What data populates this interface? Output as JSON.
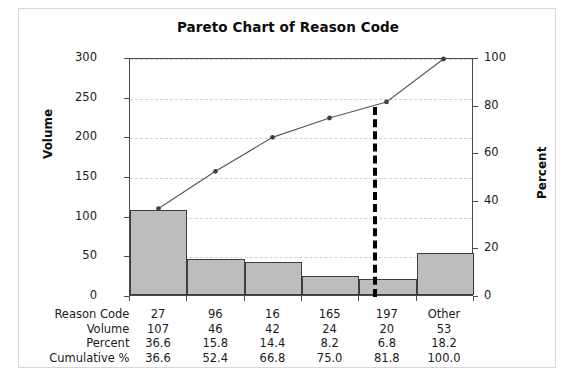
{
  "figure": {
    "title": "Pareto Chart of Reason Code"
  },
  "axes": {
    "left": {
      "label": "Volume",
      "ticks": [
        "0",
        "50",
        "100",
        "150",
        "200",
        "250",
        "300"
      ],
      "min": 0,
      "max": 300,
      "step": 50
    },
    "right": {
      "label": "Percent",
      "ticks": [
        "0",
        "20",
        "40",
        "60",
        "80",
        "100"
      ],
      "min": 0,
      "max": 100,
      "step": 20
    }
  },
  "reference_line": {
    "name": "eighty-percent-reference",
    "percent": 80,
    "color": "#000000",
    "style": "dashed"
  },
  "table": {
    "row_labels": [
      "Reason Code",
      "Volume",
      "Percent",
      "Cumulative %"
    ],
    "rows": [
      [
        "27",
        "96",
        "16",
        "165",
        "197",
        "Other"
      ],
      [
        "107",
        "46",
        "42",
        "24",
        "20",
        "53"
      ],
      [
        "36.6",
        "15.8",
        "14.4",
        "8.2",
        "6.8",
        "18.2"
      ],
      [
        "36.6",
        "52.4",
        "66.8",
        "75.0",
        "81.8",
        "100.0"
      ]
    ]
  },
  "colors": {
    "bar_fill": "#bdbdbd",
    "bar_edge": "#3d3d3d",
    "line": "#5a5a5a",
    "marker": "#404040",
    "grid": "#d2d2d2",
    "frame": "#4a4a4a"
  },
  "chart_data": {
    "type": "bar",
    "title": "Pareto Chart of Reason Code",
    "xlabel": "Reason Code",
    "ylabel": "Volume",
    "y2label": "Percent",
    "categories": [
      "27",
      "96",
      "16",
      "165",
      "197",
      "Other"
    ],
    "values": [
      107,
      46,
      42,
      24,
      20,
      53
    ],
    "percent": [
      36.6,
      15.8,
      14.4,
      8.2,
      6.8,
      18.2
    ],
    "cumulative_percent": [
      36.6,
      52.4,
      66.8,
      75.0,
      81.8,
      100.0
    ],
    "ylim": [
      0,
      300
    ],
    "y2lim": [
      0,
      100
    ],
    "yticks": [
      0,
      50,
      100,
      150,
      200,
      250,
      300
    ],
    "y2ticks": [
      0,
      20,
      40,
      60,
      80,
      100
    ],
    "grid": true,
    "legend": "none",
    "series": [
      {
        "name": "Volume",
        "type": "bar",
        "axis": "left",
        "values": [
          107,
          46,
          42,
          24,
          20,
          53
        ]
      },
      {
        "name": "Cumulative %",
        "type": "line",
        "axis": "right",
        "values": [
          36.6,
          52.4,
          66.8,
          75.0,
          81.8,
          100.0
        ]
      }
    ],
    "annotations": [
      {
        "type": "vline",
        "axis": "right",
        "value": 80,
        "style": "dashed",
        "color": "#000000"
      }
    ]
  }
}
